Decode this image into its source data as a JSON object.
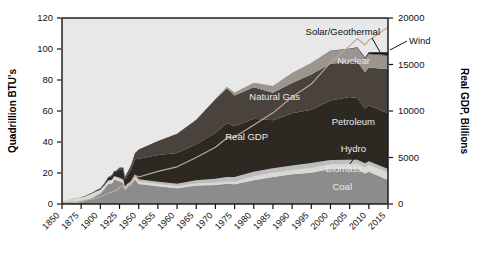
{
  "chart": {
    "type": "area",
    "left_axis_title": "Quadrillion BTU's",
    "right_axis_title": "Real GDP, Billions",
    "plot_bg": "#e8e8e8",
    "left_ticks": [
      "0",
      "20",
      "40",
      "60",
      "80",
      "100",
      "120"
    ],
    "right_ticks": [
      "0",
      "5000",
      "10000",
      "15000",
      "20000"
    ],
    "x_ticks": [
      "1850",
      "1875",
      "1900",
      "1925",
      "1950",
      "1955",
      "1960",
      "1965",
      "1970",
      "1975",
      "1980",
      "1985",
      "1990",
      "1995",
      "2000",
      "2005",
      "2010",
      "2015"
    ],
    "labels": {
      "coal": "Coal",
      "biomass": "Biomass",
      "hydro": "Hydro",
      "petroleum": "Petroleum",
      "natural_gas": "Natural Gas",
      "nuclear": "Nuclear",
      "solar_geothermal": "Solar/Geothermal",
      "wind": "Wind",
      "real_gdp": "Real GDP"
    },
    "colors": {
      "coal": "#8c8c8c",
      "biomass": "#d8d8d4",
      "hydro": "#bdbdbd",
      "petroleum": "#2e2823",
      "natural_gas": "#4a423c",
      "nuclear": "#9a958f",
      "solar_geothermal": "#6a645e",
      "wind": "#161412",
      "gdp_line": "#b9a99a",
      "axis": "#111111",
      "plot_bg": "#e8e8e8"
    }
  },
  "chart_data": {
    "type": "area",
    "title": "",
    "xlabel": "",
    "ylabel": "Quadrillion BTU's",
    "y2label": "Real GDP, Billions",
    "ylim": [
      0,
      120
    ],
    "y2lim": [
      0,
      20000
    ],
    "grid": false,
    "legend": "inline-annotations",
    "x": [
      1850,
      1855,
      1860,
      1865,
      1870,
      1875,
      1880,
      1885,
      1890,
      1895,
      1900,
      1905,
      1910,
      1915,
      1918,
      1920,
      1925,
      1930,
      1932,
      1935,
      1940,
      1945,
      1950,
      1955,
      1960,
      1965,
      1970,
      1973,
      1975,
      1980,
      1985,
      1990,
      1995,
      2000,
      2005,
      2007,
      2009,
      2010,
      2015
    ],
    "series": [
      {
        "name": "Coal",
        "color": "#8c8c8c",
        "values": [
          0.2,
          0.3,
          0.5,
          0.7,
          1.0,
          1.4,
          2.0,
          3.2,
          4.1,
          5.5,
          6.8,
          9.5,
          12.7,
          13.3,
          15.5,
          15.5,
          14.7,
          13.6,
          9.0,
          10.6,
          12.5,
          15.9,
          12.9,
          11.5,
          10.1,
          11.9,
          12.3,
          13.0,
          12.7,
          15.4,
          17.5,
          19.2,
          20.1,
          22.6,
          22.8,
          22.7,
          19.7,
          20.8,
          15.5
        ]
      },
      {
        "name": "Biomass",
        "color": "#d8d8d4",
        "values": [
          2.1,
          2.2,
          2.4,
          2.6,
          2.8,
          2.9,
          2.9,
          2.8,
          2.7,
          2.6,
          2.2,
          2.0,
          1.9,
          1.8,
          1.7,
          1.6,
          1.5,
          1.4,
          1.3,
          1.4,
          1.4,
          1.5,
          1.6,
          1.4,
          1.3,
          1.3,
          1.4,
          1.5,
          1.5,
          2.5,
          2.7,
          2.7,
          3.1,
          3.0,
          3.1,
          3.5,
          3.9,
          4.3,
          4.7
        ]
      },
      {
        "name": "Hydro",
        "color": "#bdbdbd",
        "values": [
          0,
          0,
          0,
          0,
          0,
          0,
          0,
          0,
          0.1,
          0.2,
          0.25,
          0.4,
          0.5,
          0.6,
          0.65,
          0.7,
          0.8,
          0.8,
          0.8,
          0.9,
          0.9,
          1.4,
          1.4,
          1.4,
          1.6,
          2.1,
          2.6,
          2.9,
          3.2,
          2.9,
          2.9,
          3.0,
          3.2,
          2.8,
          2.7,
          2.4,
          2.7,
          2.5,
          2.4
        ]
      },
      {
        "name": "Petroleum",
        "color": "#2e2823",
        "values": [
          0,
          0,
          0.02,
          0.05,
          0.1,
          0.15,
          0.2,
          0.3,
          0.4,
          0.5,
          0.6,
          1.0,
          1.6,
          2.3,
          2.8,
          2.7,
          5.3,
          5.9,
          4.9,
          5.3,
          7.5,
          10.1,
          13.3,
          17.3,
          19.9,
          23.2,
          29.5,
          34.8,
          32.7,
          34.2,
          30.9,
          33.6,
          34.4,
          38.3,
          40.4,
          39.8,
          35.3,
          35.9,
          36.0
        ]
      },
      {
        "name": "Natural Gas",
        "color": "#4a423c",
        "values": [
          0,
          0,
          0,
          0,
          0,
          0,
          0.05,
          0.1,
          0.2,
          0.25,
          0.25,
          0.35,
          0.5,
          0.7,
          0.8,
          0.8,
          1.2,
          1.9,
          1.6,
          1.9,
          2.7,
          3.9,
          6.0,
          9.0,
          12.4,
          15.8,
          21.8,
          22.5,
          19.9,
          20.4,
          17.8,
          19.6,
          22.7,
          23.8,
          22.6,
          23.6,
          23.4,
          24.6,
          28.4
        ]
      },
      {
        "name": "Nuclear",
        "color": "#9a958f",
        "values": [
          0,
          0,
          0,
          0,
          0,
          0,
          0,
          0,
          0,
          0,
          0,
          0,
          0,
          0,
          0,
          0,
          0,
          0,
          0,
          0,
          0,
          0,
          0,
          0,
          0.04,
          0.04,
          0.24,
          0.91,
          1.9,
          2.7,
          4.1,
          6.1,
          7.1,
          7.9,
          8.2,
          8.4,
          8.4,
          8.4,
          8.3
        ]
      },
      {
        "name": "Solar/Geothermal",
        "color": "#6a645e",
        "values": [
          0,
          0,
          0,
          0,
          0,
          0,
          0,
          0,
          0,
          0,
          0,
          0,
          0,
          0,
          0,
          0,
          0,
          0,
          0,
          0,
          0,
          0,
          0,
          0,
          0.01,
          0.04,
          0.06,
          0.05,
          0.07,
          0.11,
          0.2,
          0.3,
          0.35,
          0.35,
          0.38,
          0.4,
          0.42,
          0.45,
          0.85
        ]
      },
      {
        "name": "Wind",
        "color": "#161412",
        "values": [
          0,
          0,
          0,
          0,
          0,
          0,
          0,
          0,
          0,
          0,
          0,
          0,
          0,
          0,
          0,
          0,
          0,
          0,
          0,
          0,
          0,
          0,
          0,
          0,
          0,
          0,
          0,
          0,
          0,
          0,
          0,
          0.03,
          0.03,
          0.06,
          0.18,
          0.34,
          0.72,
          0.92,
          1.8
        ]
      }
    ],
    "overlay_line": {
      "name": "Real GDP",
      "color": "#b9a99a",
      "axis": "right",
      "unit": "Billions",
      "values": [
        120,
        150,
        180,
        200,
        240,
        300,
        380,
        440,
        540,
        620,
        760,
        950,
        1150,
        1250,
        1450,
        1400,
        1800,
        2000,
        1500,
        1750,
        2300,
        3100,
        2900,
        3500,
        4000,
        5000,
        6100,
        7100,
        7200,
        8500,
        9800,
        11500,
        12900,
        15200,
        17000,
        17800,
        17100,
        17600,
        19000
      ]
    }
  }
}
